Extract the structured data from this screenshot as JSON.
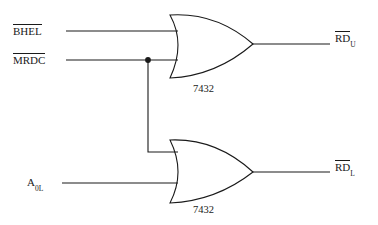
{
  "diagram": {
    "background_color": "#ffffff",
    "line_color": "#1a1a1a",
    "inputs": [
      {
        "name": "BHEL",
        "base": "BHEL",
        "subscript": "",
        "overbar": true,
        "y": 31
      },
      {
        "name": "MRDC",
        "base": "MRDC",
        "subscript": "",
        "overbar": true,
        "y": 60
      },
      {
        "name": "A0L",
        "base": "A",
        "subscript": "0L",
        "overbar": false,
        "y": 183
      }
    ],
    "outputs": [
      {
        "name": "RDU",
        "base": "RD",
        "subscript": "U",
        "overbar": true,
        "y": 44
      },
      {
        "name": "RDL",
        "base": "RD",
        "subscript": "L",
        "overbar": true,
        "y": 172
      }
    ],
    "gates": [
      {
        "id": "gate-top",
        "type": "or",
        "part_number": "7432",
        "inputs": [
          "BHEL",
          "MRDC"
        ],
        "output": "RDU"
      },
      {
        "id": "gate-bottom",
        "type": "or",
        "part_number": "7432",
        "inputs": [
          "MRDC",
          "A0L"
        ],
        "output": "RDL"
      }
    ],
    "junction": {
      "label": "MRDC-fanout-node",
      "x": 148,
      "y": 60
    }
  }
}
